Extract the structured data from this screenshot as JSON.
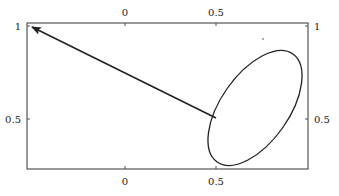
{
  "figure": {
    "type": "diagram",
    "frame": {
      "x0": 27,
      "y0": 23,
      "x1": 308,
      "y1": 169,
      "stroke": "#555555"
    },
    "axes": {
      "top": {
        "ticks": [
          {
            "label": "0",
            "px": 125
          },
          {
            "label": "0.5",
            "px": 216
          }
        ]
      },
      "bottom": {
        "ticks": [
          {
            "label": "0",
            "px": 125
          },
          {
            "label": "0.5",
            "px": 216
          }
        ]
      },
      "left": {
        "ticks": [
          {
            "label": "1",
            "py": 26
          },
          {
            "label": "0.5",
            "py": 119
          }
        ]
      },
      "right": {
        "ticks": [
          {
            "label": "1",
            "py": 26
          },
          {
            "label": "0.5",
            "py": 119
          }
        ]
      }
    },
    "ellipse": {
      "cx": 255,
      "cy": 108,
      "rx": 34,
      "ry": 66,
      "rotate": 35,
      "stroke": "#222222"
    },
    "arrow": {
      "from": [
        216,
        118
      ],
      "to": [
        32,
        27
      ],
      "stroke": "#222222"
    },
    "dot": {
      "x": 263,
      "y": 39
    }
  },
  "labels": {
    "top_0": "0",
    "top_05": "0.5",
    "bottom_0": "0",
    "bottom_05": "0.5",
    "left_1": "1",
    "left_05": "0.5",
    "right_1": "1",
    "right_05": "0.5"
  }
}
